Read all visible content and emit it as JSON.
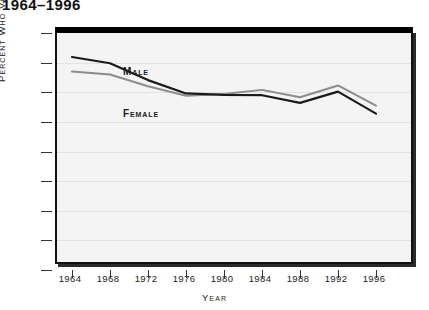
{
  "chart_data": {
    "type": "line",
    "title": "1964–1996",
    "xlabel": "Year",
    "ylabel": "Percent Who Voted",
    "x": [
      1964,
      1968,
      1972,
      1976,
      1980,
      1984,
      1988,
      1992,
      1996
    ],
    "categories": [
      "1964",
      "1968",
      "1972",
      "1976",
      "1980",
      "1984",
      "1988",
      "1992",
      "1996"
    ],
    "xlim": [
      1964,
      1996
    ],
    "ylim": [
      0,
      80
    ],
    "yticks": [
      0,
      10,
      20,
      30,
      40,
      50,
      60,
      70,
      80
    ],
    "ytick_labels": [
      "0",
      "10",
      "20",
      "30",
      "40",
      "50",
      "60",
      "70",
      "80"
    ],
    "grid": true,
    "legend": "inline-labels",
    "series": [
      {
        "name": "Male",
        "color": "#1a1a1a",
        "line_width": 2.2,
        "values": [
          71.9,
          69.8,
          64.1,
          59.6,
          59.1,
          59.0,
          56.4,
          60.2,
          52.8
        ]
      },
      {
        "name": "Female",
        "color": "#8c8c8c",
        "line_width": 2.0,
        "values": [
          67.0,
          66.0,
          62.0,
          58.8,
          59.4,
          60.8,
          58.3,
          62.3,
          55.5
        ]
      }
    ],
    "annotations": [
      {
        "text": "Male",
        "series": "Male"
      },
      {
        "text": "Female",
        "series": "Female"
      }
    ]
  }
}
